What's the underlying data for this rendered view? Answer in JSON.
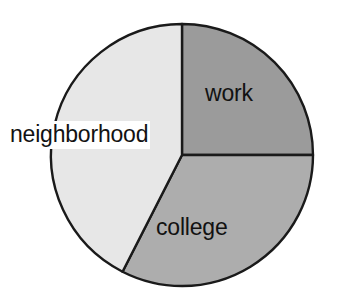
{
  "chart_data": {
    "type": "pie",
    "title": "",
    "subtitle": "",
    "xlabel": "",
    "ylabel": "",
    "legend_position": "none",
    "grid": false,
    "labels_inside": true,
    "start_angle_deg": 0,
    "direction": "clockwise",
    "categories": [
      "work",
      "college",
      "neighborhood"
    ],
    "values": [
      25,
      32.5,
      42.5
    ],
    "units": "percent",
    "slices": [
      {
        "label": "work",
        "value": 25,
        "percent": 25,
        "angle_deg": 90,
        "start_deg": 0,
        "end_deg": 90,
        "color": "#9b9b9b"
      },
      {
        "label": "college",
        "value": 32.5,
        "percent": 32.5,
        "angle_deg": 117,
        "start_deg": 90,
        "end_deg": 207,
        "color": "#adadad"
      },
      {
        "label": "neighborhood",
        "value": 42.5,
        "percent": 42.5,
        "angle_deg": 153,
        "start_deg": 207,
        "end_deg": 360,
        "color": "#e7e7e7"
      }
    ],
    "colors": {
      "work": "#9b9b9b",
      "college": "#adadad",
      "neighborhood": "#e7e7e7",
      "outline": "#1a1a1a",
      "background": "#ffffff",
      "label_text": "#121212"
    },
    "geometry": {
      "center_x": 182,
      "center_y": 155,
      "radius": 131
    }
  },
  "labels": {
    "work": "work",
    "college": "college",
    "neighborhood": "neighborhood"
  }
}
